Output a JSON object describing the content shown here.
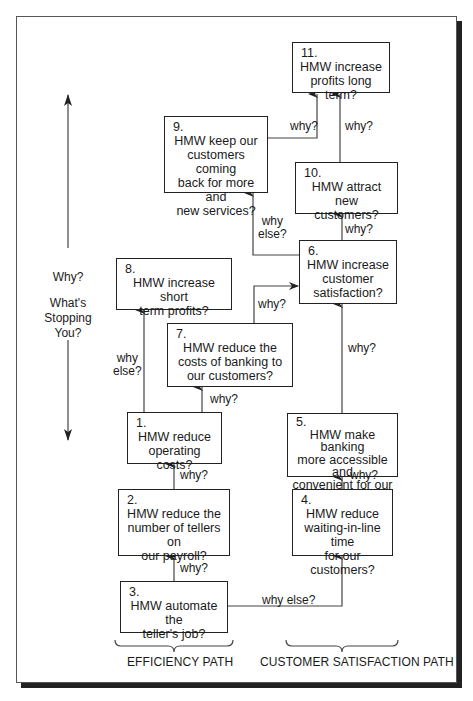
{
  "diagram": {
    "type": "why-how ladder / HMW (How Might We) abstraction diagram",
    "side_axis": {
      "top_label": "Why?",
      "bottom_label": "What's Stopping You?"
    },
    "boxes": [
      {
        "id": 1,
        "number": "1.",
        "text": "HMW reduce operating costs?"
      },
      {
        "id": 2,
        "number": "2.",
        "text": "HMW reduce the number of tellers on our payroll?"
      },
      {
        "id": 3,
        "number": "3.",
        "text": "HMW automate the teller's job?"
      },
      {
        "id": 4,
        "number": "4.",
        "text": "HMW reduce waiting-in-line time for our customers?"
      },
      {
        "id": 5,
        "number": "5.",
        "text": "HMW make banking more accessible and convenient for our customers?"
      },
      {
        "id": 6,
        "number": "6.",
        "text": "HMW increase customer satisfaction?"
      },
      {
        "id": 7,
        "number": "7.",
        "text": "HMW reduce the costs of banking to our customers?"
      },
      {
        "id": 8,
        "number": "8.",
        "text": "HMW increase short term profits?"
      },
      {
        "id": 9,
        "number": "9.",
        "text": "HMW keep our customers coming back for more and new services?"
      },
      {
        "id": 10,
        "number": "10.",
        "text": "HMW attract new customers?"
      },
      {
        "id": 11,
        "number": "11.",
        "text": "HMW increase profits long term?"
      }
    ],
    "edges": [
      {
        "from": 3,
        "to": 2,
        "label": "why?"
      },
      {
        "from": 2,
        "to": 1,
        "label": "why?"
      },
      {
        "from": 1,
        "to": 8,
        "label": "why else?"
      },
      {
        "from": 1,
        "to": 7,
        "label": "why?"
      },
      {
        "from": 7,
        "to": 6,
        "label": "why?"
      },
      {
        "from": 3,
        "to": 4,
        "label": "why else?"
      },
      {
        "from": 4,
        "to": 5,
        "label": "why?"
      },
      {
        "from": 5,
        "to": 6,
        "label": "why?"
      },
      {
        "from": 6,
        "to": 10,
        "label": "why?"
      },
      {
        "from": 6,
        "to": 9,
        "label": "why else?"
      },
      {
        "from": 10,
        "to": 11,
        "label": "why?"
      },
      {
        "from": 9,
        "to": 11,
        "label": "why?"
      }
    ],
    "path_labels": {
      "left": "EFFICIENCY PATH",
      "right": "CUSTOMER SATISFACTION PATH"
    },
    "edge_labels": {
      "why": "why?",
      "why_else_line1": "why",
      "why_else_line2": "else?",
      "why_else": "why else?"
    }
  },
  "side": {
    "why": "Why?",
    "whats": "What's",
    "stopping": "Stopping",
    "you": "You?"
  },
  "boxes": {
    "b1": {
      "num": "1.",
      "l1": "HMW reduce",
      "l2": "operating costs?"
    },
    "b2": {
      "num": "2.",
      "l1": "HMW reduce the",
      "l2": "number of tellers on",
      "l3": "our payroll?"
    },
    "b3": {
      "num": "3.",
      "l1": "HMW automate the",
      "l2": "teller's job?"
    },
    "b4": {
      "num": "4.",
      "l1": "HMW reduce",
      "l2": "waiting-in-line time",
      "l3": "for our customers?"
    },
    "b5": {
      "num": "5.",
      "l1": "HMW make banking",
      "l2": "more accessible and",
      "l3": "convenient for our",
      "l4": "customers?"
    },
    "b6": {
      "num": "6.",
      "l1": "HMW increase",
      "l2": "customer",
      "l3": "satisfaction?"
    },
    "b7": {
      "num": "7.",
      "l1": "HMW reduce the",
      "l2": "costs of banking to",
      "l3": "our customers?"
    },
    "b8": {
      "num": "8.",
      "l1": "HMW increase short",
      "l2": "term profits?"
    },
    "b9": {
      "num": "9.",
      "l1": "HMW keep our",
      "l2": "customers coming",
      "l3": "back for more and",
      "l4": "new services?"
    },
    "b10": {
      "num": "10.",
      "l1": "HMW attract new",
      "l2": "customers?"
    },
    "b11": {
      "num": "11.",
      "l1": "HMW increase",
      "l2": "profits long term?"
    }
  },
  "labels": {
    "why": "why?",
    "why_word": "why",
    "else_word": "else?",
    "why_else": "why else?"
  },
  "paths": {
    "efficiency": "EFFICIENCY PATH",
    "customer": "CUSTOMER SATISFACTION PATH"
  },
  "caption": {
    "text": "Fig. 10.5  Sample problem ladder (why-how chart) — caption partially cut off"
  }
}
